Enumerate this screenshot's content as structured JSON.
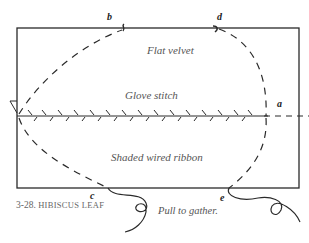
{
  "figure": {
    "caption_number": "3-28.",
    "caption_title": "HIBISCUS LEAF"
  },
  "regions": {
    "top": "Flat velvet",
    "middle": "Glove stitch",
    "bottom": "Shaded wired ribbon"
  },
  "points": {
    "a": "a",
    "b": "b",
    "c": "c",
    "d": "d",
    "e": "e"
  },
  "instruction": "Pull to gather.",
  "colors": {
    "line": "#2a2a2a",
    "text": "#555555"
  }
}
